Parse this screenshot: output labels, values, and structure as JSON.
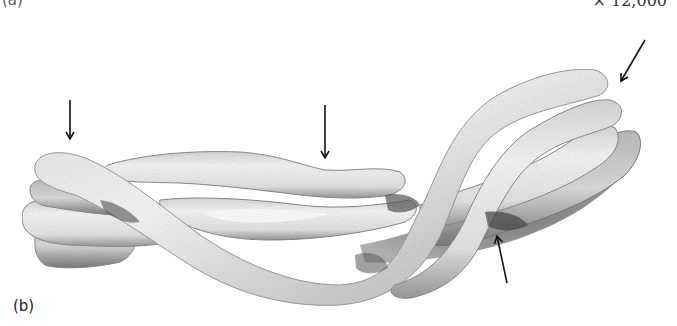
{
  "figure": {
    "panel_label": "(b)",
    "previous_panel_label": "(a)",
    "magnification": "× 12,000",
    "strand_count": 4,
    "arrows": [
      {
        "id": "arrow-1",
        "direction": "down",
        "x1": 70,
        "y1": 100,
        "x2": 70,
        "y2": 139
      },
      {
        "id": "arrow-2",
        "direction": "down",
        "x1": 325,
        "y1": 105,
        "x2": 325,
        "y2": 158
      },
      {
        "id": "arrow-3",
        "direction": "down-left",
        "x1": 645,
        "y1": 40,
        "x2": 621,
        "y2": 81
      },
      {
        "id": "arrow-4",
        "direction": "up",
        "x1": 507,
        "y1": 283,
        "x2": 497,
        "y2": 236
      }
    ],
    "colors": {
      "background": "#ffffff",
      "strand_fill": "#efefef",
      "strand_shadow": "#6a6a6a",
      "arrow": "#111111"
    }
  }
}
